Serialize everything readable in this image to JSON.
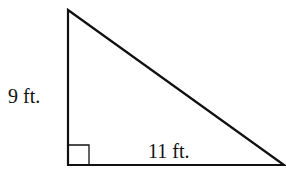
{
  "diagram": {
    "type": "right-triangle",
    "labels": {
      "vertical_leg": "9 ft.",
      "horizontal_leg": "11 ft."
    },
    "right_angle_marker": true,
    "colors": {
      "stroke": "#111111",
      "background": "#ffffff"
    }
  }
}
